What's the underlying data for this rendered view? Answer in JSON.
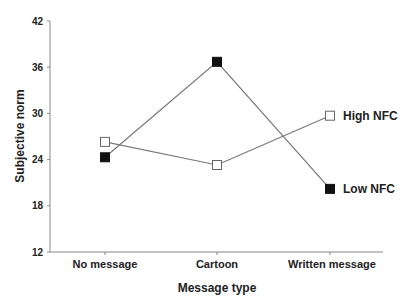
{
  "chart_data": {
    "type": "line",
    "title": "",
    "xlabel": "Message type",
    "ylabel": "Subjective norm",
    "categories": [
      "No message",
      "Cartoon",
      "Written message"
    ],
    "ylim": [
      12,
      42
    ],
    "yticks": [
      12,
      18,
      24,
      30,
      36,
      42
    ],
    "grid": false,
    "legend_position": "inline-right",
    "series": [
      {
        "name": "High NFC",
        "marker": "open-square",
        "values": [
          26.3,
          23.3,
          29.7
        ]
      },
      {
        "name": "Low NFC",
        "marker": "filled-square",
        "values": [
          24.3,
          36.7,
          20.2
        ]
      }
    ]
  },
  "colors": {
    "line": "#777777",
    "marker_fill": "#111111",
    "axis": "#888888",
    "text": "#222222"
  }
}
